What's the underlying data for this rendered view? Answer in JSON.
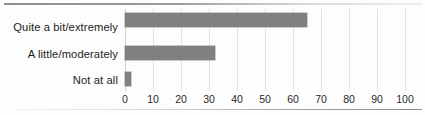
{
  "chart_data": {
    "type": "bar",
    "orientation": "horizontal",
    "title": "",
    "subtitle": "",
    "xlabel": "",
    "ylabel": "",
    "categories": [
      "Quite a bit/extremely",
      "A little/moderately",
      "Not at all"
    ],
    "values": [
      65,
      32,
      2
    ],
    "series": [
      {
        "name": "",
        "values": [
          65,
          32,
          2
        ]
      }
    ],
    "xlim": [
      0,
      100
    ],
    "xticks": [
      0,
      10,
      20,
      30,
      40,
      50,
      60,
      70,
      80,
      90,
      100
    ],
    "xtick_labels": [
      "0",
      "10",
      "20",
      "30",
      "40",
      "50",
      "60",
      "70",
      "80",
      "90",
      "100"
    ],
    "grid": "vertical",
    "legend": "none",
    "bar_color": "#808080",
    "grid_color": "#e3e3e3",
    "background_color": "#fdfdfd",
    "annotations": []
  }
}
